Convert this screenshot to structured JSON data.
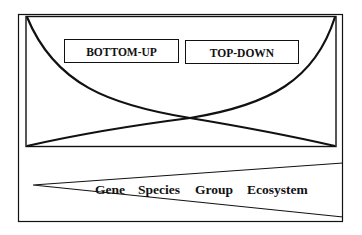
{
  "diagram": {
    "colors": {
      "stroke": "#111111",
      "background": "#ffffff"
    },
    "approach_labels": {
      "bottom_up": "BOTTOM-UP",
      "top_down": "TOP-DOWN"
    },
    "scale_levels": [
      "Gene",
      "Species",
      "Group",
      "Ecosystem"
    ],
    "elements": {
      "upper_panel": "crossing curves showing relative emphasis of bottom-up vs top-down approaches",
      "lower_panel": "widening wedge indicating increasing organizational scale"
    }
  }
}
